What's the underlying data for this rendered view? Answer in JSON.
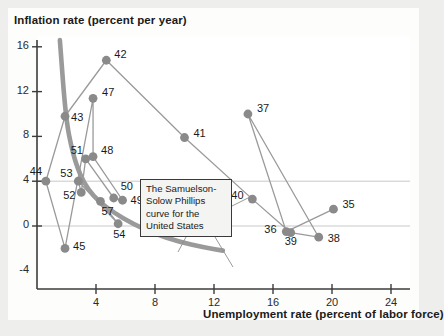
{
  "chart_data": {
    "type": "scatter",
    "title": "Inflation rate (percent per year)",
    "xlabel": "Unemployment rate (percent of labor force)",
    "ylabel": "Inflation rate (percent per year)",
    "xlim": [
      0,
      26
    ],
    "ylim": [
      -4,
      17
    ],
    "xticks": [
      4,
      8,
      12,
      16,
      20,
      24
    ],
    "xtick_labels": [
      "4",
      "8",
      "12",
      "16",
      "20",
      "24"
    ],
    "yticks": [
      -4,
      0,
      4,
      8,
      12,
      16
    ],
    "ytick_labels": [
      "-4",
      "0",
      "4",
      "8",
      "12",
      "16"
    ],
    "grid": "horizontal gridlines at y = 0 and y = 4",
    "legend": "none",
    "point_label_field": "year (last two digits)",
    "points": [
      {
        "label": "35",
        "x": 20.1,
        "y": 1.5
      },
      {
        "label": "36",
        "x": 16.9,
        "y": -0.5
      },
      {
        "label": "37",
        "x": 14.3,
        "y": 10.0
      },
      {
        "label": "38",
        "x": 19.1,
        "y": -1.0
      },
      {
        "label": "39",
        "x": 17.2,
        "y": -0.6
      },
      {
        "label": "40",
        "x": 14.6,
        "y": 2.4
      },
      {
        "label": "41",
        "x": 10.0,
        "y": 7.9
      },
      {
        "label": "42",
        "x": 4.7,
        "y": 14.8
      },
      {
        "label": "43",
        "x": 1.9,
        "y": 9.8
      },
      {
        "label": "44",
        "x": 0.6,
        "y": 4.0
      },
      {
        "label": "45",
        "x": 1.9,
        "y": -2.0
      },
      {
        "label": "47",
        "x": 3.8,
        "y": 11.4
      },
      {
        "label": "48",
        "x": 3.8,
        "y": 6.2
      },
      {
        "label": "49",
        "x": 5.8,
        "y": 2.3
      },
      {
        "label": "50",
        "x": 5.2,
        "y": 2.5
      },
      {
        "label": "51",
        "x": 3.3,
        "y": 6.0
      },
      {
        "label": "52",
        "x": 3.0,
        "y": 3.0
      },
      {
        "label": "53",
        "x": 2.8,
        "y": 4.0
      },
      {
        "label": "54",
        "x": 5.5,
        "y": 0.2
      },
      {
        "label": "57",
        "x": 4.3,
        "y": 2.2
      }
    ],
    "connection_order": [
      "35",
      "36",
      "37",
      "38",
      "39",
      "40",
      "41",
      "42",
      "43",
      "44",
      "45",
      "47",
      "48",
      "49",
      "50",
      "51",
      "52",
      "53",
      "54",
      "57"
    ],
    "fitted_curve": {
      "name": "The Samuelson-Solow Phillips curve for the United States",
      "description": "Downward-sloping convex curve through the scatter",
      "points": [
        {
          "x": 1.55,
          "y": 16.6
        },
        {
          "x": 1.95,
          "y": 9.6
        },
        {
          "x": 2.4,
          "y": 6.6
        },
        {
          "x": 2.9,
          "y": 4.6
        },
        {
          "x": 3.5,
          "y": 3.2
        },
        {
          "x": 4.2,
          "y": 2.2
        },
        {
          "x": 5.2,
          "y": 1.2
        },
        {
          "x": 6.5,
          "y": 0.2
        },
        {
          "x": 8.0,
          "y": -0.7
        },
        {
          "x": 9.6,
          "y": -1.4
        },
        {
          "x": 11.3,
          "y": -1.9
        },
        {
          "x": 12.6,
          "y": -2.2
        }
      ]
    },
    "colors": {
      "point": "#8a8a8a",
      "connector": "#9a9a9a",
      "curve": "#9a9a9a",
      "axis": "#3c3c3c",
      "gridline": "#c9c9c9",
      "background": "#ffffff",
      "page_background": "#eeeeec",
      "text": "#1a1a1a"
    }
  },
  "annotation": {
    "line1": "The Samuelson-",
    "line2": "Solow Phillips",
    "line3": "curve for the",
    "line4": "United States"
  }
}
